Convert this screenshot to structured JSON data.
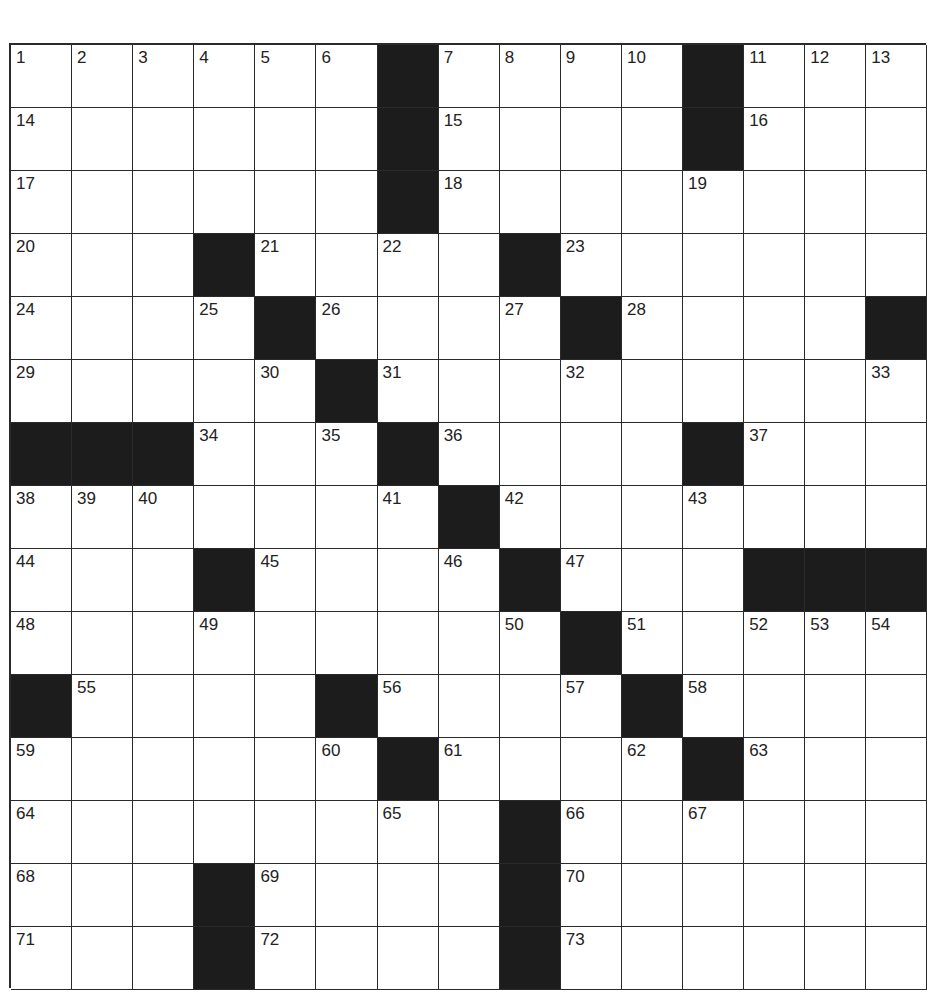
{
  "puzzle": {
    "size": {
      "rows": 15,
      "cols": 15
    },
    "colors": {
      "black": "#1c1c1c",
      "white": "#ffffff",
      "line": "#2a2a2a",
      "number": "#222222"
    },
    "grid": [
      [
        "1",
        "2",
        "3",
        "4",
        "5",
        "6",
        "#",
        "7",
        "8",
        "9",
        "10",
        "#",
        "11",
        "12",
        "13"
      ],
      [
        "14",
        ".",
        ".",
        ".",
        ".",
        ".",
        "#",
        "15",
        ".",
        ".",
        ".",
        "#",
        "16",
        ".",
        "."
      ],
      [
        "17",
        ".",
        ".",
        ".",
        ".",
        ".",
        "#",
        "18",
        ".",
        ".",
        ".",
        "19",
        ".",
        ".",
        "."
      ],
      [
        "20",
        ".",
        ".",
        "#",
        "21",
        ".",
        "22",
        ".",
        "#",
        "23",
        ".",
        ".",
        ".",
        ".",
        "."
      ],
      [
        "24",
        ".",
        ".",
        "25",
        "#",
        "26",
        ".",
        ".",
        "27",
        "#",
        "28",
        ".",
        ".",
        ".",
        "#"
      ],
      [
        "29",
        ".",
        ".",
        ".",
        "30",
        "#",
        "31",
        ".",
        ".",
        "32",
        ".",
        ".",
        ".",
        ".",
        "33"
      ],
      [
        "#",
        "#",
        "#",
        "34",
        ".",
        "35",
        "#",
        "36",
        ".",
        ".",
        ".",
        "#",
        "37",
        ".",
        "."
      ],
      [
        "38",
        "39",
        "40",
        ".",
        ".",
        ".",
        "41",
        "#",
        "42",
        ".",
        ".",
        "43",
        ".",
        ".",
        "."
      ],
      [
        "44",
        ".",
        ".",
        "#",
        "45",
        ".",
        ".",
        "46",
        "#",
        "47",
        ".",
        ".",
        "#",
        "#",
        "#"
      ],
      [
        "48",
        ".",
        ".",
        "49",
        ".",
        ".",
        ".",
        ".",
        "50",
        "#",
        "51",
        ".",
        "52",
        "53",
        "54"
      ],
      [
        "#",
        "55",
        ".",
        ".",
        ".",
        "#",
        "56",
        ".",
        ".",
        "57",
        "#",
        "58",
        ".",
        ".",
        "."
      ],
      [
        "59",
        ".",
        ".",
        ".",
        ".",
        "60",
        "#",
        "61",
        ".",
        ".",
        "62",
        "#",
        "63",
        ".",
        "."
      ],
      [
        "64",
        ".",
        ".",
        ".",
        ".",
        ".",
        "65",
        ".",
        "#",
        "66",
        ".",
        "67",
        ".",
        ".",
        "."
      ],
      [
        "68",
        ".",
        ".",
        "#",
        "69",
        ".",
        ".",
        ".",
        "#",
        "70",
        ".",
        ".",
        ".",
        ".",
        "."
      ],
      [
        "71",
        ".",
        ".",
        "#",
        "72",
        ".",
        ".",
        ".",
        "#",
        "73",
        ".",
        ".",
        ".",
        ".",
        "."
      ]
    ]
  }
}
